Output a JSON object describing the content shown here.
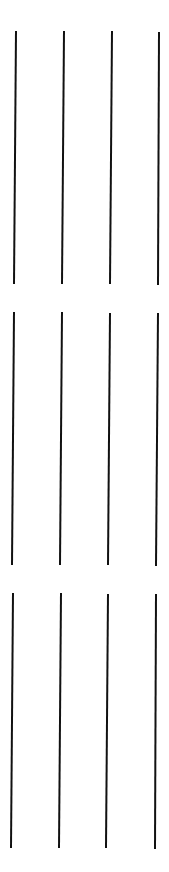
{
  "canvas": {
    "width": 169,
    "height": 872,
    "background": "#ffffff"
  },
  "stroke": {
    "color": "#111111",
    "width": 2
  },
  "groups": [
    {
      "name": "group-1",
      "lines": [
        {
          "x1": 16,
          "y1": 31,
          "x2": 14,
          "y2": 284
        },
        {
          "x1": 64,
          "y1": 31,
          "x2": 62,
          "y2": 284
        },
        {
          "x1": 112,
          "y1": 31,
          "x2": 110,
          "y2": 284
        },
        {
          "x1": 159,
          "y1": 32,
          "x2": 158,
          "y2": 285
        }
      ]
    },
    {
      "name": "group-2",
      "lines": [
        {
          "x1": 14,
          "y1": 312,
          "x2": 12,
          "y2": 565
        },
        {
          "x1": 62,
          "y1": 312,
          "x2": 60,
          "y2": 565
        },
        {
          "x1": 110,
          "y1": 313,
          "x2": 108,
          "y2": 565
        },
        {
          "x1": 158,
          "y1": 313,
          "x2": 156,
          "y2": 566
        }
      ]
    },
    {
      "name": "group-3",
      "lines": [
        {
          "x1": 13,
          "y1": 593,
          "x2": 11,
          "y2": 848
        },
        {
          "x1": 61,
          "y1": 593,
          "x2": 59,
          "y2": 848
        },
        {
          "x1": 108,
          "y1": 594,
          "x2": 106,
          "y2": 848
        },
        {
          "x1": 156,
          "y1": 594,
          "x2": 155,
          "y2": 849
        }
      ]
    }
  ]
}
